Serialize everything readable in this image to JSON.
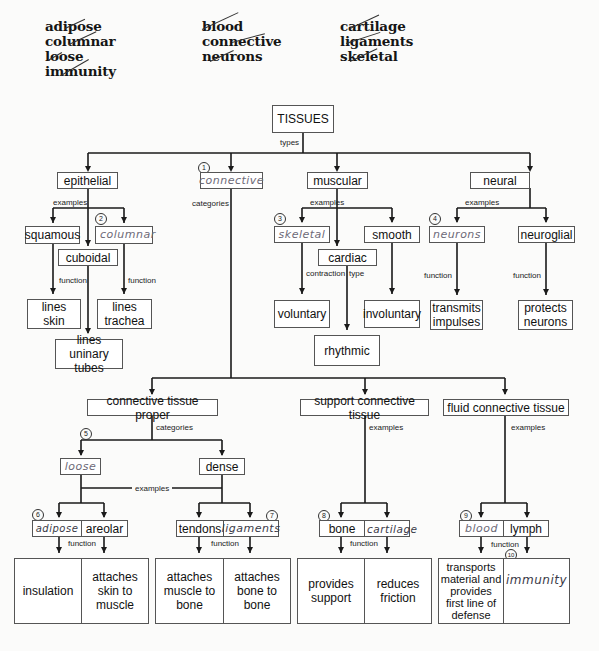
{
  "word_bank": {
    "columns": [
      [
        "adipose",
        "columnar",
        "loose",
        "immunity"
      ],
      [
        "blood",
        "connective",
        "neurons"
      ],
      [
        "cartilage",
        "ligaments",
        "skeletal"
      ]
    ],
    "all_crossed_out": true
  },
  "root": {
    "label": "TISSUES",
    "edge": "types"
  },
  "types": {
    "epithelial": {
      "label": "epithelial",
      "edge": "examples",
      "squamous": "squamous",
      "columnar": {
        "number": "2",
        "answer": "columnar"
      },
      "cuboidal": "cuboidal",
      "function_label": "function",
      "squamous_fn": [
        "lines",
        "skin"
      ],
      "columnar_fn": [
        "lines",
        "trachea"
      ],
      "cuboidal_fn": [
        "lines",
        "uninary tubes"
      ]
    },
    "connective": {
      "number": "1",
      "answer": "connective",
      "edge": "categories"
    },
    "muscular": {
      "label": "muscular",
      "edge": "examples",
      "skeletal": {
        "number": "3",
        "answer": "skeletal"
      },
      "cardiac": "cardiac",
      "smooth": "smooth",
      "edge_contraction": "contraction",
      "edge_type": "type",
      "skeletal_fn": "voluntary",
      "smooth_fn": "involuntary",
      "cardiac_fn": "rhythmic"
    },
    "neural": {
      "label": "neural",
      "edge": "examples",
      "neurons": {
        "number": "4",
        "answer": "neurons"
      },
      "neuroglial": "neuroglial",
      "function_label": "function",
      "neurons_fn": [
        "transmits",
        "impulses"
      ],
      "neuroglial_fn": [
        "protects",
        "neurons"
      ]
    }
  },
  "connective_categories": {
    "proper": {
      "label": "connective tissue proper",
      "edge": "categories",
      "loose": {
        "number": "5",
        "answer": "loose"
      },
      "dense": "dense",
      "examples_label": "examples",
      "adipose": {
        "number": "6",
        "answer": "adipose"
      },
      "areolar": "areolar",
      "tendons": "tendons",
      "ligaments": {
        "number": "7",
        "answer": "ligaments"
      },
      "function_label": "function",
      "adipose_fn": "insulation",
      "areolar_fn": [
        "attaches",
        "skin to",
        "muscle"
      ],
      "tendons_fn": [
        "attaches",
        "muscle to",
        "bone"
      ],
      "ligaments_fn": [
        "attaches",
        "bone to",
        "bone"
      ]
    },
    "support": {
      "label": "support connective tissue",
      "edge": "examples",
      "bone": "bone",
      "cartilage": {
        "number": "8",
        "answer": "cartilage"
      },
      "function_label": "function",
      "bone_fn": [
        "provides",
        "support"
      ],
      "cartilage_fn": [
        "reduces",
        "friction"
      ]
    },
    "fluid": {
      "label": "fluid connective tissue",
      "edge": "examples",
      "blood": {
        "number": "9",
        "answer": "blood"
      },
      "lymph": "lymph",
      "function_label": "function",
      "blood_fn": [
        "transports",
        "material and",
        "provides",
        "first line of",
        "defense"
      ],
      "lymph_fn": {
        "number": "10",
        "answer": "immunity"
      }
    }
  },
  "colors": {
    "line": "#1a1a1a",
    "box_border": "#555555",
    "handwriting": "#6d6a78",
    "background": "#fbfbfa"
  }
}
